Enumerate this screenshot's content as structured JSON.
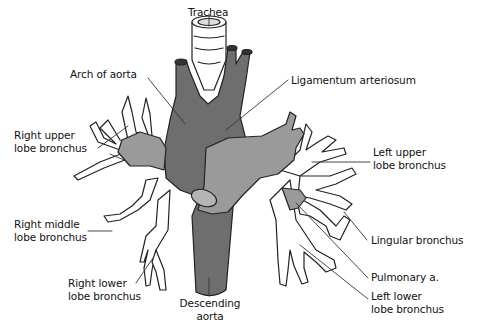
{
  "diagram": {
    "type": "anatomical",
    "colors": {
      "aorta": "#6e6e6e",
      "pulmonary_artery": "#9a9a9a",
      "bronchus_fill": "#ffffff",
      "outline": "#222222",
      "leader_line": "#333333"
    },
    "labels": {
      "trachea": "Trachea",
      "arch_of_aorta": "Arch of aorta",
      "ligamentum_arteriosum": "Ligamentum arteriosum",
      "right_upper_lobe_bronchus": [
        "Right upper",
        "lobe bronchus"
      ],
      "left_upper_lobe_bronchus": [
        "Left upper",
        "lobe bronchus"
      ],
      "right_middle_lobe_bronchus": [
        "Right middle",
        "lobe bronchus"
      ],
      "lingular_bronchus": "Lingular bronchus",
      "pulmonary_artery": "Pulmonary a.",
      "right_lower_lobe_bronchus": [
        "Right lower",
        "lobe bronchus"
      ],
      "left_lower_lobe_bronchus": [
        "Left lower",
        "lobe bronchus"
      ],
      "descending_aorta": [
        "Descending",
        "aorta"
      ]
    }
  }
}
